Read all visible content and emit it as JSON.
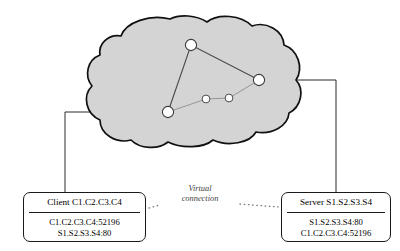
{
  "diagram": {
    "colors": {
      "cloud_fill": "#d4d4d4",
      "cloud_stroke": "#101010",
      "node_fill": "#ffffff",
      "node_stroke": "#3a3a3a",
      "link_stroke": "#4a4a4a",
      "connector_stroke": "#2b2b2b",
      "box_stroke": "#1a1a1a",
      "text": "#000000",
      "virtual_label_text": "#3d3d3d"
    },
    "cloud": {
      "name": "network-cloud",
      "nodes": [
        {
          "id": "top",
          "label": "",
          "cx": 191,
          "cy": 45,
          "r": 5.6
        },
        {
          "id": "left",
          "label": "",
          "cx": 168,
          "cy": 112,
          "r": 5.6
        },
        {
          "id": "right",
          "label": "",
          "cx": 259,
          "cy": 80,
          "r": 5.6
        },
        {
          "id": "mid1",
          "label": "",
          "cx": 206,
          "cy": 99,
          "r": 3.9
        },
        {
          "id": "mid2",
          "label": "",
          "cx": 229,
          "cy": 98,
          "r": 3.9
        }
      ],
      "links": [
        {
          "from": "left",
          "to": "top",
          "style": "solid"
        },
        {
          "from": "top",
          "to": "right",
          "style": "solid"
        },
        {
          "from": "left",
          "to": "mid1",
          "style": "faint"
        },
        {
          "from": "mid1",
          "to": "mid2",
          "style": "faint"
        },
        {
          "from": "mid2",
          "to": "right",
          "style": "faint"
        }
      ]
    },
    "client": {
      "name": "client-endpoint",
      "header": "Client C1.C2.C3.C4",
      "lines": [
        "C1.C2.C3.C4:52196",
        "S1.S2.S3.S4:80"
      ]
    },
    "server": {
      "name": "server-endpoint",
      "header": "Server S1.S2.S3.S4",
      "lines": [
        "S1.S2.S3.S4:80",
        "C1.C2.C3.C4:52196"
      ]
    },
    "virtual_connection": {
      "name": "virtual-connection",
      "label_line1": "Virtual",
      "label_line2": "connection",
      "style": "dotted"
    }
  }
}
